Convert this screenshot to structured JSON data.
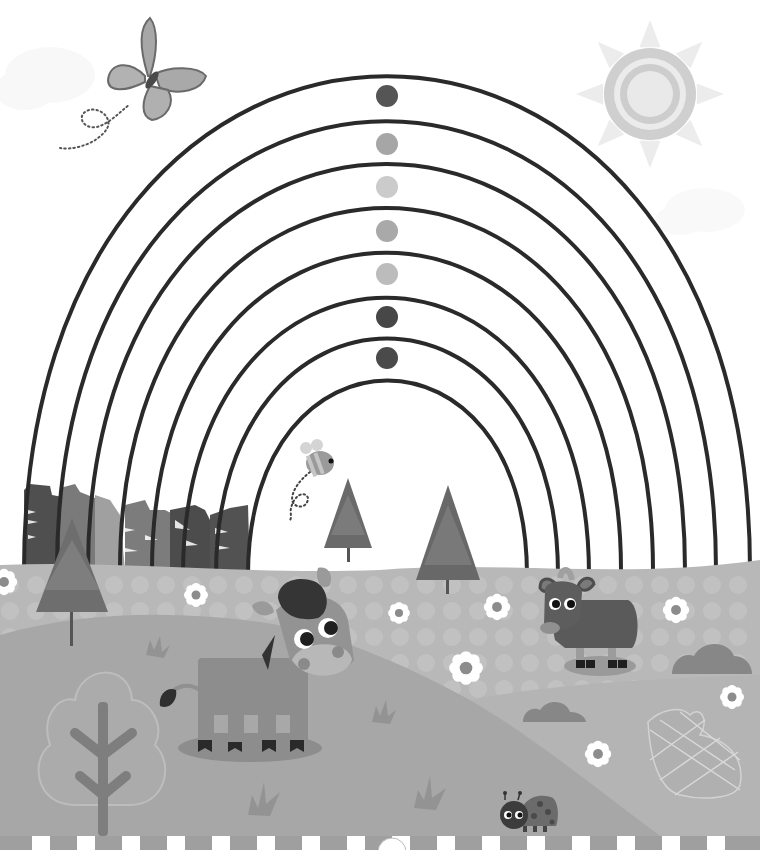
{
  "page": {
    "type": "coloring-activity-illustration",
    "theme": "rainbow-countryside"
  },
  "palette": {
    "background": "#ffffff",
    "arc_stroke": "#2a2a2a",
    "sun_ray": "#ececec",
    "sun_ring": "#cfcfcf",
    "sun_core": "#e9e9e9",
    "mountain_dark": "#4e4e4e",
    "mountain_mid": "#767676",
    "mountain_light": "#9a9a9a",
    "hill_back": "#b9b9b9",
    "hill_mid": "#a3a3a3",
    "hill_front": "#a8a8a8",
    "hill_right": "#b2b2b2",
    "flower_petal": "#ffffff",
    "flower_center": "#8c8c8c",
    "fence_post": "#ffffff",
    "fence_gap": "#9f9f9f"
  },
  "rainbow": {
    "bands": 8,
    "color_dots": [
      {
        "band": 1,
        "shade": "#555555"
      },
      {
        "band": 2,
        "shade": "#a6a6a6"
      },
      {
        "band": 3,
        "shade": "#cbcbcb"
      },
      {
        "band": 4,
        "shade": "#a9a9a9"
      },
      {
        "band": 5,
        "shade": "#bcbcbc"
      },
      {
        "band": 6,
        "shade": "#474747"
      },
      {
        "band": 7,
        "shade": "#4a4a4a"
      }
    ]
  },
  "characters": [
    {
      "name": "butterfly",
      "label": "Butterfly"
    },
    {
      "name": "bee",
      "label": "Bee"
    },
    {
      "name": "donkey",
      "label": "Donkey"
    },
    {
      "name": "goat",
      "label": "Goat"
    },
    {
      "name": "ladybird",
      "label": "Ladybird"
    },
    {
      "name": "rabbit",
      "label": "Rabbit outline"
    }
  ],
  "scenery": {
    "trees": 3,
    "flowers": 8,
    "bushes": 2,
    "grass_tufts": 4,
    "fence_posts": 16
  }
}
